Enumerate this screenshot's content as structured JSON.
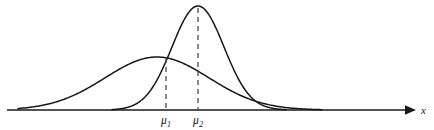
{
  "figure": {
    "background_color": "#ffffff",
    "curve_color": "#161616",
    "axis_color": "#1a1a1a",
    "dash_color": "#4c4c4c",
    "width": 434,
    "height": 130,
    "axis_label": "x",
    "mean_labels": [
      {
        "base": "μ",
        "sub": "1"
      },
      {
        "base": "μ",
        "sub": "2"
      }
    ]
  },
  "chart_data": {
    "type": "line",
    "title": "",
    "subtitle": "",
    "xlabel": "x",
    "ylabel": "",
    "grid": false,
    "legend": "none",
    "annotations": [
      "μ₁",
      "μ₂"
    ],
    "axis_baseline_y": 110,
    "axis_x_start": 7,
    "axis_x_end": 415,
    "xlim": [
      0,
      434
    ],
    "ylim": [
      0,
      130
    ],
    "series": [
      {
        "name": "wide-low-normal",
        "mean_px": 157,
        "sigma_px": 52,
        "peak_px": {
          "x": 157,
          "y": 57
        },
        "peak_height_px": 53,
        "x_range_px": [
          18,
          322
        ],
        "mean_label": "μ₁"
      },
      {
        "name": "narrow-tall-normal",
        "mean_px": 198,
        "sigma_px": 26,
        "peak_px": {
          "x": 198,
          "y": 6
        },
        "peak_height_px": 104,
        "x_range_px": [
          112,
          286
        ],
        "mean_label": "μ₂"
      }
    ],
    "mean_markers": [
      {
        "label": "μ₁",
        "x_px": 166,
        "dash_top_y": 58,
        "dash_bottom_y": 110,
        "label_y": 124
      },
      {
        "label": "μ₂",
        "x_px": 198,
        "dash_top_y": 8,
        "dash_bottom_y": 110,
        "label_y": 124
      }
    ]
  }
}
